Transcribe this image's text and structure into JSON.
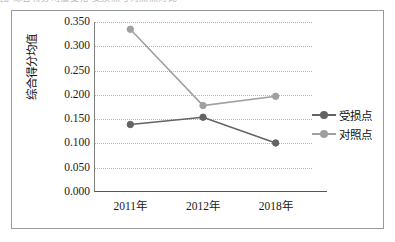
{
  "caption": {
    "sliver_text": "图 综合得分均值变化 受损点与对照点对比"
  },
  "chart_data": {
    "type": "line",
    "title": "",
    "xlabel": "",
    "ylabel": "综合得分均值",
    "categories": [
      "2011年",
      "2012年",
      "2018年"
    ],
    "series": [
      {
        "name": "受损点",
        "values": [
          0.139,
          0.154,
          0.101
        ],
        "color": "#636363"
      },
      {
        "name": "对照点",
        "values": [
          0.335,
          0.178,
          0.197
        ],
        "color": "#a0a0a0"
      }
    ],
    "ylim": [
      0.0,
      0.35
    ],
    "ytick_step": 0.05,
    "ytick_labels": [
      "0.000",
      "0.050",
      "0.100",
      "0.150",
      "0.200",
      "0.250",
      "0.300",
      "0.350"
    ],
    "ytick_values": [
      0.0,
      0.05,
      0.1,
      0.15,
      0.2,
      0.25,
      0.3,
      0.35
    ],
    "grid": true,
    "grid_style": "dotted",
    "grid_color": "#b5b5b5",
    "legend_position": "right",
    "axis_color": "#555555",
    "frame_color": "#9a9a9a",
    "background": "#ffffff"
  }
}
